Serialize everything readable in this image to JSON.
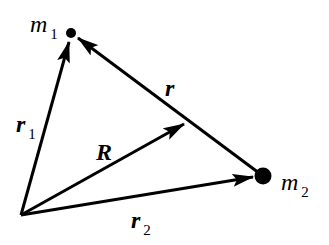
{
  "diagram": {
    "colors": {
      "stroke": "#000000",
      "background": "#ffffff"
    },
    "points": {
      "origin": {
        "x": 21,
        "y": 215
      },
      "m1": {
        "x": 71,
        "y": 33,
        "radius": 5
      },
      "m2": {
        "x": 263,
        "y": 176,
        "radius": 8
      },
      "cm": {
        "x": 185,
        "y": 124
      }
    },
    "labels": {
      "m1": {
        "symbol": "m",
        "subscript": "1"
      },
      "m2": {
        "symbol": "m",
        "subscript": "2"
      },
      "r1": {
        "symbol": "r",
        "subscript": "1"
      },
      "r2": {
        "symbol": "r",
        "subscript": "2"
      },
      "R": {
        "symbol": "R"
      },
      "r": {
        "symbol": "r"
      }
    },
    "vectors": [
      {
        "name": "r1",
        "from": "origin",
        "to": "m1"
      },
      {
        "name": "r2",
        "from": "origin",
        "to": "m2"
      },
      {
        "name": "R",
        "from": "origin",
        "to": "cm"
      },
      {
        "name": "r",
        "from": "m2",
        "to": "m1"
      }
    ]
  }
}
